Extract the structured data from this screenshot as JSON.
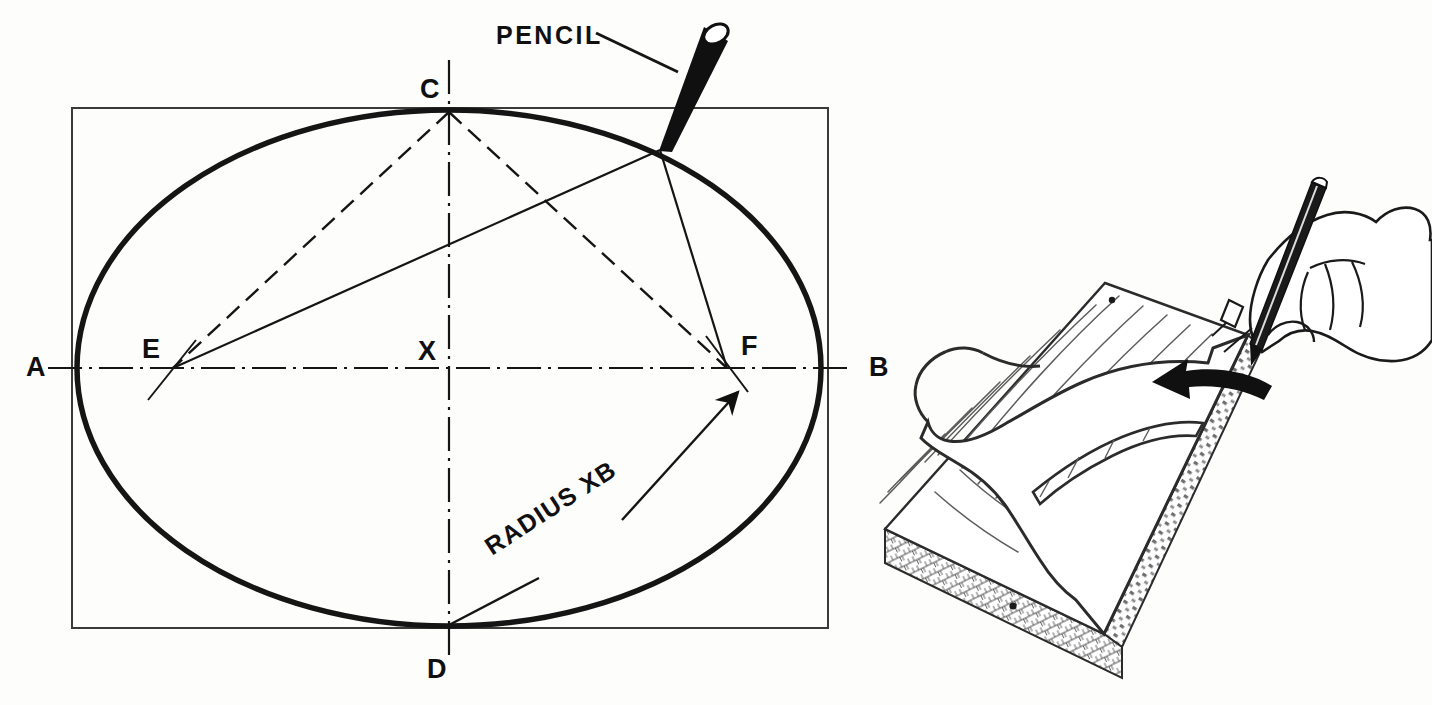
{
  "figure": {
    "ink_color": "#101010",
    "paper_color": "#fdfdfb",
    "thin_line_color": "#3a3a3a"
  },
  "left_diagram": {
    "name": "ellipse-construction",
    "labels": {
      "pencil": "PENCIL",
      "radius": "RADIUS XB",
      "point_a": "A",
      "point_b": "B",
      "point_c": "C",
      "point_d": "D",
      "point_e": "E",
      "point_f": "F",
      "point_x": "X"
    },
    "geometry": {
      "rect": {
        "x": 72,
        "y": 108,
        "width": 756,
        "height": 520
      },
      "ellipse": {
        "cx": 449,
        "cy": 368,
        "rx": 372,
        "ry": 258
      },
      "center_point": {
        "x": 449,
        "y": 368
      },
      "focus_e": {
        "x": 173,
        "y": 368
      },
      "focus_f": {
        "x": 727,
        "y": 368
      },
      "vertex_c": {
        "x": 449,
        "y": 110
      },
      "vertex_d": {
        "x": 449,
        "y": 627
      },
      "vertex_a": {
        "x": 77,
        "y": 368
      },
      "vertex_b": {
        "x": 821,
        "y": 368
      },
      "pencil_contact": {
        "x": 660,
        "y": 150
      },
      "pencil_top": {
        "x": 716,
        "y": 33
      }
    },
    "label_positions": {
      "point_a": {
        "x": 26,
        "y": 376
      },
      "point_b": {
        "x": 869,
        "y": 376
      },
      "point_c": {
        "x": 420,
        "y": 98
      },
      "point_d": {
        "x": 427,
        "y": 678
      },
      "point_e": {
        "x": 142,
        "y": 358
      },
      "point_f": {
        "x": 741,
        "y": 355
      },
      "point_x": {
        "x": 418,
        "y": 360
      },
      "pencil": {
        "x": 496,
        "y": 44
      },
      "radius": {
        "x": 492,
        "y": 556,
        "rotation": -33
      }
    }
  },
  "right_illustration": {
    "name": "board-template-tracing",
    "description": "Hand holding a pencil tracing a template pattern onto a plywood board, with a black curved arrow indicating direction of travel",
    "parts": [
      "plywood-board",
      "board-edge-laminations",
      "template-pattern",
      "template-interior-cutout",
      "wood-grain-lines",
      "hand",
      "pencil",
      "direction-arrow",
      "nail-head-upper",
      "nail-head-lower"
    ],
    "arrow_direction": "left"
  }
}
